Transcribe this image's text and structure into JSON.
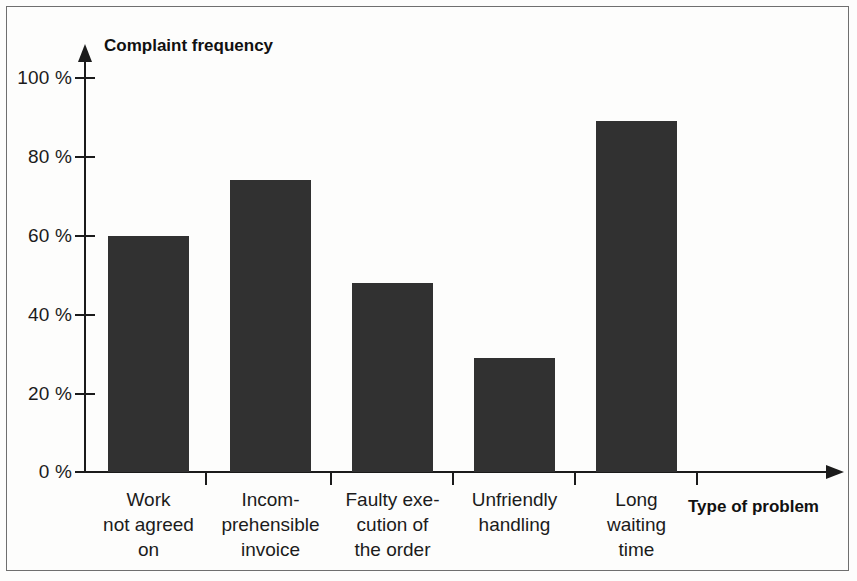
{
  "chart_data": {
    "type": "bar",
    "title": "",
    "xlabel": "Type of problem",
    "ylabel": "Complaint frequency",
    "categories": [
      "Work\nnot agreed\non",
      "Incom-\nprehensible\ninvoice",
      "Faulty exe-\ncution of\nthe order",
      "Unfriendly\nhandling",
      "Long\nwaiting\ntime"
    ],
    "values": [
      60,
      74,
      48,
      29,
      89
    ],
    "ylim": [
      0,
      100
    ],
    "ytick_values": [
      0,
      20,
      40,
      60,
      80,
      100
    ],
    "ytick_labels": [
      "0 %",
      "20 %",
      "40 %",
      "60 %",
      "80 %",
      "100 %"
    ],
    "grid": false,
    "legend": null,
    "bar_color": "#313131",
    "axis_color": "#1b1b1b",
    "background_color": "#fdfdfc",
    "units": "%",
    "axis_arrows": true,
    "x_tick_marks_between_categories": true
  }
}
